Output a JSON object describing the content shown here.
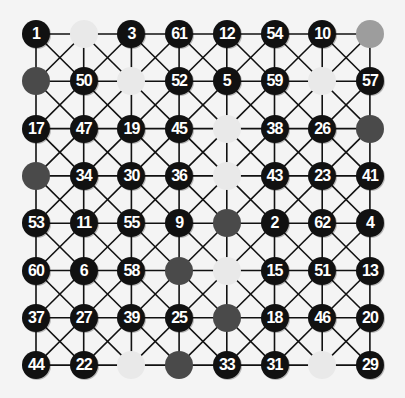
{
  "puzzle": {
    "rows": 8,
    "cols": 8,
    "colors": {
      "background": "#f4f4f4",
      "line": "#111111",
      "number_fill": "#111111",
      "number_text": "#ffffff",
      "dark": "#4a4a4a",
      "light": "#e9e9e9",
      "medium": "#9d9d9d"
    },
    "grid": [
      [
        "1",
        "L",
        "3",
        "61",
        "12",
        "54",
        "10",
        "M"
      ],
      [
        "D",
        "50",
        "L",
        "52",
        "5",
        "59",
        "L",
        "57"
      ],
      [
        "17",
        "47",
        "19",
        "45",
        "L",
        "38",
        "26",
        "D"
      ],
      [
        "D",
        "34",
        "30",
        "36",
        "L",
        "43",
        "23",
        "41"
      ],
      [
        "53",
        "11",
        "55",
        "9",
        "D",
        "2",
        "62",
        "4"
      ],
      [
        "60",
        "6",
        "58",
        "D",
        "L",
        "15",
        "51",
        "13"
      ],
      [
        "37",
        "27",
        "39",
        "25",
        "D",
        "18",
        "46",
        "20"
      ],
      [
        "44",
        "22",
        "L",
        "D",
        "33",
        "31",
        "L",
        "29"
      ]
    ]
  }
}
